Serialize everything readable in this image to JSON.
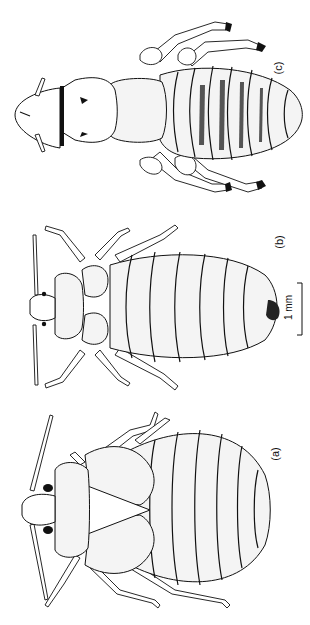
{
  "figure": {
    "caption_fragment": "",
    "orientation": "rotated 90° counter-clockwise",
    "specimens": [
      {
        "id": "a",
        "label": "(a)",
        "description": "broad oval insect with dark eyes, triangular scutellum, dotted abdomen"
      },
      {
        "id": "b",
        "label": "(b)",
        "description": "oval bug with hairy margins, segmented abdomen, long antennae"
      },
      {
        "id": "c",
        "label": "(c)",
        "description": "elongate hairy insect with banded abdomen and clawed legs"
      }
    ],
    "scale_bar": {
      "label": "1 mm"
    }
  },
  "colors": {
    "ink": "#111111",
    "paper": "#ffffff"
  }
}
